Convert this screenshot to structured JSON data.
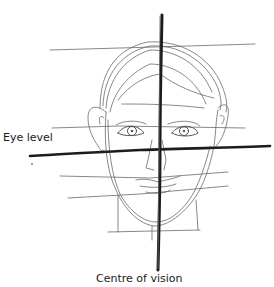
{
  "diagram": {
    "labels": {
      "eye_level": "Eye level",
      "centre_of_vision": "Centre of vision"
    },
    "colors": {
      "background": "#ffffff",
      "guide_line_thick": "#1c1c1c",
      "sketch_line": "#6a6a6a",
      "text": "#1a1a1a"
    }
  }
}
